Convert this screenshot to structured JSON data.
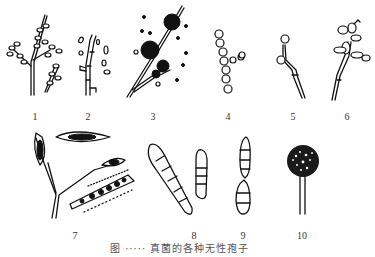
{
  "figure": {
    "caption": "图 ·····  真菌的各种无性孢子",
    "ink_color": "#111111",
    "background": "#ffffff",
    "panels": [
      {
        "id": 1,
        "label": "1",
        "label_x": 35,
        "label_y": 112,
        "icon": "branched-conidiophore-icon"
      },
      {
        "id": 2,
        "label": "2",
        "label_x": 88,
        "label_y": 112,
        "icon": "arthrospore-hypha-icon"
      },
      {
        "id": 3,
        "label": "3",
        "label_x": 153,
        "label_y": 112,
        "icon": "blastospore-cluster-icon"
      },
      {
        "id": 4,
        "label": "4",
        "label_x": 228,
        "label_y": 112,
        "icon": "spore-chain-icon"
      },
      {
        "id": 5,
        "label": "5",
        "label_x": 293,
        "label_y": 112,
        "icon": "chlamydospore-icon"
      },
      {
        "id": 6,
        "label": "6",
        "label_x": 347,
        "label_y": 112,
        "icon": "petal-conidia-icon"
      },
      {
        "id": 7,
        "label": "7",
        "label_x": 75,
        "label_y": 231,
        "icon": "fusiform-macroconidia-icon"
      },
      {
        "id": 8,
        "label": "8",
        "label_x": 194,
        "label_y": 231,
        "icon": "septate-clavate-conidia-icon"
      },
      {
        "id": 9,
        "label": "9",
        "label_x": 243,
        "label_y": 231,
        "icon": "septate-spindle-conidia-icon"
      },
      {
        "id": 10,
        "label": "10",
        "label_x": 302,
        "label_y": 231,
        "icon": "sporangium-icon"
      }
    ]
  }
}
